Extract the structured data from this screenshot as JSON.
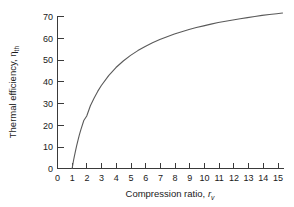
{
  "chart_data": {
    "type": "line",
    "title": "",
    "xlabel": "Compression ratio, r_v",
    "xlabel_main": "Compression ratio, ",
    "xlabel_symbol": "r",
    "xlabel_sub": "v",
    "ylabel": "Thermal efficiency, ηth",
    "ylabel_main": "Thermal efficiency, η",
    "ylabel_sub": "th",
    "xlim": [
      0,
      15.5
    ],
    "ylim": [
      0,
      72
    ],
    "xticks": [
      0,
      1,
      2,
      3,
      4,
      5,
      6,
      7,
      8,
      9,
      10,
      11,
      12,
      13,
      14,
      15
    ],
    "yticks": [
      0,
      10,
      20,
      30,
      40,
      50,
      60,
      70
    ],
    "xtick_labels": [
      "0",
      "1",
      "2",
      "3",
      "4",
      "5",
      "6",
      "7",
      "8",
      "9",
      "10",
      "11",
      "12",
      "13",
      "14",
      "15"
    ],
    "ytick_labels": [
      "0",
      "10",
      "20",
      "30",
      "40",
      "50",
      "60",
      "70"
    ],
    "grid": false,
    "legend": null,
    "curve_color": "#5a5a5a",
    "axis_color": "#3a3a3a",
    "series": [
      {
        "name": "Otto cycle thermal efficiency",
        "x": [
          1.0,
          1.05,
          1.1,
          1.15,
          1.2,
          1.3,
          1.4,
          1.5,
          1.6,
          1.8,
          2.0,
          2.25,
          2.5,
          2.75,
          3.0,
          3.5,
          4.0,
          4.5,
          5.0,
          5.5,
          6.0,
          6.5,
          7.0,
          7.5,
          8.0,
          8.5,
          9.0,
          9.5,
          10.0,
          10.5,
          11.0,
          11.5,
          12.0,
          12.5,
          13.0,
          13.5,
          14.0,
          14.5,
          15.0,
          15.4
        ],
        "y": [
          0.0,
          1.9,
          3.8,
          5.5,
          7.1,
          10.2,
          13.0,
          15.6,
          17.9,
          22.1,
          24.2,
          28.9,
          32.4,
          35.5,
          38.2,
          42.8,
          46.5,
          49.5,
          52.1,
          54.3,
          56.2,
          57.9,
          59.4,
          60.7,
          61.9,
          63.0,
          64.0,
          64.9,
          65.7,
          66.5,
          67.2,
          67.8,
          68.4,
          69.0,
          69.5,
          70.0,
          70.5,
          70.9,
          71.3,
          71.6
        ],
        "formula_note": "eta_th = 1 - 1/r^(k-1), k = 1.4, expressed in percent"
      }
    ],
    "readings": {
      "at_r1": 0,
      "at_r2": 24,
      "at_r4": 46,
      "at_r6": 56,
      "at_r8": 62,
      "at_r10": 66,
      "at_r12": 68,
      "at_r15": 67
    }
  }
}
